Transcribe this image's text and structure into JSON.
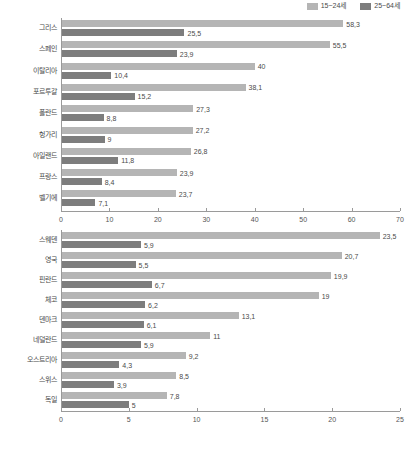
{
  "legend": {
    "items": [
      {
        "label": "15~24세",
        "color": "#b5b5b5",
        "name": "series-15-24"
      },
      {
        "label": "25~64세",
        "color": "#7d7d7d",
        "name": "series-25-64"
      }
    ]
  },
  "footnote": {
    "text": ""
  },
  "chart_data": [
    {
      "id": "chart-1",
      "type": "bar",
      "orientation": "horizontal",
      "title": "",
      "xlabel": "",
      "ylabel": "",
      "xlim": [
        0,
        70
      ],
      "xticks": [
        0,
        10,
        20,
        30,
        40,
        50,
        60,
        70
      ],
      "xtick_labels": [
        "0",
        "10",
        "20",
        "30",
        "40",
        "50",
        "60",
        "70"
      ],
      "grid": false,
      "legend_position": "top-right",
      "categories": [
        "그리스",
        "스페인",
        "이탈리아",
        "포르투갈",
        "폴란드",
        "헝가리",
        "아일랜드",
        "프랑스",
        "벨기에"
      ],
      "series": [
        {
          "name": "15~24세",
          "color": "#b5b5b5",
          "values": [
            58.3,
            55.5,
            40,
            38.1,
            27.3,
            27.2,
            26.8,
            23.9,
            23.7
          ],
          "labels": [
            "58,3",
            "55,5",
            "40",
            "38,1",
            "27,3",
            "27,2",
            "26,8",
            "23,9",
            "23,7"
          ]
        },
        {
          "name": "25~64세",
          "color": "#7d7d7d",
          "values": [
            25.5,
            23.9,
            10.4,
            15.2,
            8.8,
            9,
            11.8,
            8.4,
            7.1
          ],
          "labels": [
            "25,5",
            "23,9",
            "10,4",
            "15,2",
            "8,8",
            "9",
            "11,8",
            "8,4",
            "7,1"
          ]
        }
      ]
    },
    {
      "id": "chart-2",
      "type": "bar",
      "orientation": "horizontal",
      "title": "",
      "xlabel": "",
      "ylabel": "",
      "xlim": [
        0,
        25
      ],
      "xticks": [
        0,
        5,
        10,
        15,
        20,
        25
      ],
      "xtick_labels": [
        "0",
        "5",
        "10",
        "15",
        "20",
        "25"
      ],
      "grid": false,
      "legend_position": "none",
      "categories": [
        "스웨덴",
        "영국",
        "핀란드",
        "체코",
        "덴마크",
        "네덜란드",
        "오스트리아",
        "스위스",
        "독일"
      ],
      "series": [
        {
          "name": "15~24세",
          "color": "#b5b5b5",
          "values": [
            23.5,
            20.7,
            19.9,
            19,
            13.1,
            11,
            9.2,
            8.5,
            7.8
          ],
          "labels": [
            "23,5",
            "20,7",
            "19,9",
            "19",
            "13,1",
            "11",
            "9,2",
            "8,5",
            "7,8"
          ]
        },
        {
          "name": "25~64세",
          "color": "#7d7d7d",
          "values": [
            5.9,
            5.5,
            6.7,
            6.2,
            6.1,
            5.9,
            4.3,
            3.9,
            5
          ],
          "labels": [
            "5,9",
            "5,5",
            "6,7",
            "6,2",
            "6,1",
            "5,9",
            "4,3",
            "3,9",
            "5"
          ]
        }
      ]
    }
  ]
}
